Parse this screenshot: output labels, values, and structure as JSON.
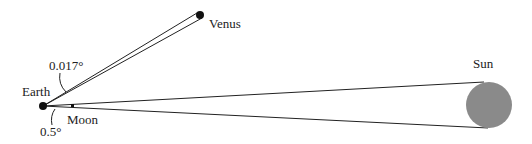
{
  "labels": {
    "venus": "Venus",
    "earth": "Earth",
    "moon": "Moon",
    "sun": "Sun",
    "venus_angle": "0.017°",
    "moon_angle": "0.5°"
  },
  "colors": {
    "line": "#222222",
    "dot": "#111111",
    "sun_fill": "#8a8a8a"
  }
}
